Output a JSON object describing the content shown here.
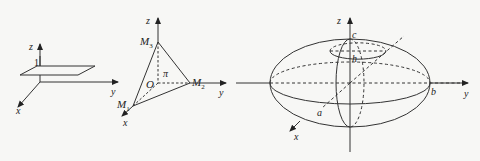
{
  "figures": [
    {
      "id": "plane-z1",
      "axes": {
        "x": "x",
        "y": "y",
        "z": "z"
      },
      "labels": {
        "height": "1"
      }
    },
    {
      "id": "tetrahedron-plane",
      "axes": {
        "x": "x",
        "y": "y",
        "z": "z"
      },
      "points": {
        "origin": "O",
        "m1": "M",
        "m1_sub": "1",
        "m2": "M",
        "m2_sub": "2",
        "m3": "M",
        "m3_sub": "3"
      },
      "plane_label": "π"
    },
    {
      "id": "ellipsoid",
      "axes": {
        "x": "x",
        "y": "y",
        "z": "z"
      },
      "semi_axes": {
        "a": "a",
        "b": "b",
        "c": "c"
      },
      "section_height": "h"
    }
  ],
  "colors": {
    "stroke": "#333333",
    "background": "#f7f7f5"
  }
}
